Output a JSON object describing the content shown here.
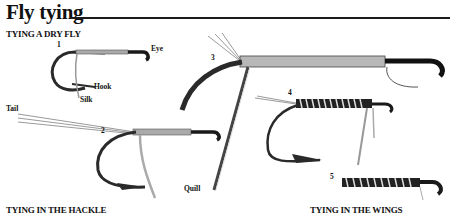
{
  "title": "Fly tying",
  "sections": {
    "dry_fly": "TYING A DRY FLY",
    "hackle": "TYING IN THE HACKLE",
    "wings": "TYING IN THE WINGS"
  },
  "steps": [
    "1",
    "2",
    "3",
    "4",
    "5"
  ],
  "labels": {
    "eye": "Eye",
    "hook": "Hook",
    "silk": "Silk",
    "tail": "Tail",
    "quill": "Quill"
  },
  "colors": {
    "ink": "#1a1a1a",
    "hook": "#2a2a2a",
    "silk": "#b8b8b8",
    "background": "#ffffff"
  }
}
